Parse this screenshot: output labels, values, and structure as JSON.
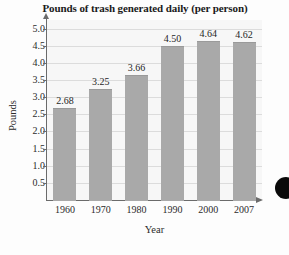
{
  "chart_data": {
    "type": "bar",
    "title": "Pounds of trash generated daily (per person)",
    "xlabel": "Year",
    "ylabel": "Pounds",
    "categories": [
      "1960",
      "1970",
      "1980",
      "1990",
      "2000",
      "2007"
    ],
    "values": [
      2.68,
      3.25,
      3.66,
      4.5,
      4.64,
      4.62
    ],
    "data_labels": [
      "2.68",
      "3.25",
      "3.66",
      "4.50",
      "4.64",
      "4.62"
    ],
    "ylim": [
      0,
      5.25
    ],
    "ytick_labels": [
      "5.0",
      "4.5",
      "4.0",
      "3.5",
      "3.0",
      "2.5",
      "2.0",
      "1.5",
      "1.0",
      "0.5"
    ],
    "ytick_values": [
      5.0,
      4.5,
      4.0,
      3.5,
      3.0,
      2.5,
      2.0,
      1.5,
      1.0,
      0.5
    ],
    "grid": true,
    "legend": null,
    "bar_color": "#a9a9a9",
    "plot_background": "#f7f7f7",
    "axis_color": "#6b6b6b",
    "text_color": "#1f1f1f"
  },
  "artifact": {
    "name": "black-circle-scan-artifact"
  }
}
